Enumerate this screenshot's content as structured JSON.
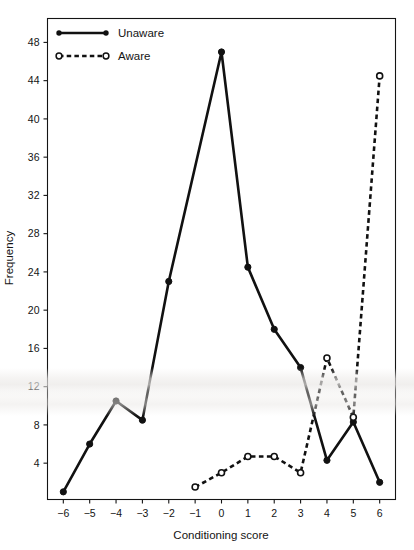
{
  "chart_data": {
    "type": "line",
    "title": "",
    "xlabel": "Conditioning score",
    "ylabel": "Frequency",
    "x": [
      -6,
      -5,
      -4,
      -3,
      -2,
      -1,
      0,
      1,
      2,
      3,
      4,
      5,
      6
    ],
    "xticklabels": [
      "−6",
      "−5",
      "−4",
      "−3",
      "−2",
      "−1",
      "0",
      "1",
      "2",
      "3",
      "4",
      "5",
      "6"
    ],
    "yticks": [
      4,
      8,
      12,
      16,
      20,
      24,
      28,
      32,
      36,
      40,
      44,
      48
    ],
    "yticklabels": [
      "4",
      "8",
      "12",
      "16",
      "20",
      "24",
      "28",
      "32",
      "36",
      "40",
      "44",
      "48"
    ],
    "xlim": [
      -6.6,
      6.6
    ],
    "ylim": [
      0.2,
      50.5
    ],
    "grid": false,
    "legend_position": "top-left",
    "series": [
      {
        "name": "Unaware",
        "style": "solid",
        "marker": "filled-circle",
        "color": "#111111",
        "x": [
          -6,
          -5,
          -4,
          -3,
          -2,
          -1,
          0,
          1,
          2,
          3,
          4,
          5,
          6
        ],
        "values": [
          1,
          6,
          10.5,
          8.5,
          23,
          null,
          47,
          24.5,
          18,
          14,
          4.3,
          8.3,
          2
        ]
      },
      {
        "name": "Aware",
        "style": "dashed",
        "marker": "open-circle",
        "color": "#111111",
        "x": [
          -1,
          0,
          1,
          2,
          3,
          4,
          5,
          6
        ],
        "values": [
          1.5,
          3,
          4.7,
          4.7,
          3,
          15,
          8.8,
          44.5
        ]
      }
    ]
  },
  "legend": {
    "items": [
      {
        "label": "Unaware",
        "marker": "filled-circle",
        "style": "solid"
      },
      {
        "label": "Aware",
        "marker": "open-circle",
        "style": "dashed"
      }
    ]
  },
  "axes": {
    "x_title": "Conditioning score",
    "y_title": "Frequency"
  },
  "artifacts": {
    "caption_fragment": ""
  }
}
